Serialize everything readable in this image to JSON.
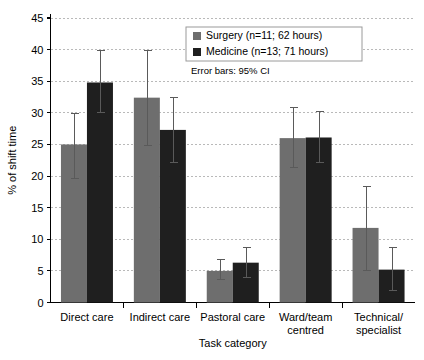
{
  "chart_data": {
    "type": "bar",
    "title": "",
    "xlabel": "Task category",
    "ylabel": "% of shift time",
    "ylim": [
      0,
      45
    ],
    "ytick_step": 5,
    "yticks": [
      0,
      5,
      10,
      15,
      20,
      25,
      30,
      35,
      40,
      45
    ],
    "grid": true,
    "legend_position": "top-right",
    "annotation": "Error bars: 95% CI",
    "categories": [
      "Direct care",
      "Indirect care",
      "Pastoral care",
      "Ward/team centred",
      "Technical/ specialist"
    ],
    "category_lines": [
      [
        "Direct care"
      ],
      [
        "Indirect care"
      ],
      [
        "Pastoral care"
      ],
      [
        "Ward/team",
        "centred"
      ],
      [
        "Technical/",
        "specialist"
      ]
    ],
    "series": [
      {
        "name": "Surgery (n=11; 62 hours)",
        "color": "#6e6e6e",
        "values": [
          25.0,
          32.4,
          5.0,
          26.0,
          11.8
        ],
        "ci_low": [
          19.5,
          24.8,
          3.5,
          21.3,
          5.0
        ],
        "ci_high": [
          30.0,
          40.0,
          6.9,
          31.0,
          18.5
        ]
      },
      {
        "name": "Medicine (n=13; 71 hours)",
        "color": "#1f1f1f",
        "values": [
          34.8,
          27.3,
          6.3,
          26.1,
          5.2
        ],
        "ci_low": [
          30.0,
          22.0,
          3.8,
          22.0,
          1.8
        ],
        "ci_high": [
          40.0,
          32.5,
          8.8,
          30.3,
          8.8
        ]
      }
    ]
  },
  "colors": {
    "surgery": "#6e6e6e",
    "medicine": "#1f1f1f",
    "grid": "#b9b9b9",
    "axis": "#000000",
    "error_bar": "#5a5a5a"
  }
}
